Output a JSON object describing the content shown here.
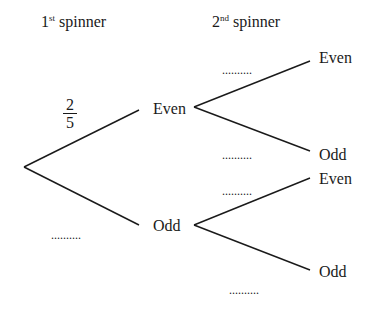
{
  "headers": {
    "first": {
      "num": "1",
      "suffix": "st",
      "text": "spinner"
    },
    "second": {
      "num": "2",
      "suffix": "nd",
      "text": "spinner"
    }
  },
  "first_spinner": {
    "branches": [
      {
        "label": "Even",
        "probability": {
          "numerator": "2",
          "denominator": "5"
        }
      },
      {
        "label": "Odd",
        "probability": ".........."
      }
    ]
  },
  "second_spinner": {
    "after_even": [
      {
        "label": "Even",
        "probability": ".........."
      },
      {
        "label": "Odd",
        "probability": ".........."
      }
    ],
    "after_odd": [
      {
        "label": "Even",
        "probability": ".........."
      },
      {
        "label": "Odd",
        "probability": ".........."
      }
    ]
  },
  "colors": {
    "line": "#1a1a1a",
    "background": "#ffffff"
  }
}
